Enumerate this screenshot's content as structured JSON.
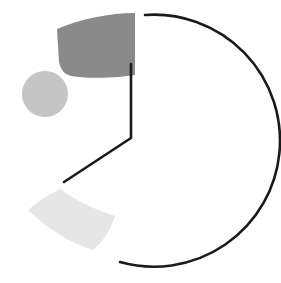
{
  "figure": {
    "title": "",
    "background": "#ffffff",
    "width": 281,
    "height": 283
  },
  "chart_data": {
    "type": "pie",
    "title": "",
    "subtitle": "",
    "xlabel": "",
    "ylabel": "",
    "legend": [],
    "grid": false,
    "center": [
      131,
      138
    ],
    "radius": 126,
    "start_angle_deg": 90,
    "direction": "clockwise",
    "exploded": true,
    "labels": [
      "Segment 1",
      "Segment 2",
      "Segment 3",
      "Segment 4"
    ],
    "values": [
      48.6,
      17.5,
      6.4,
      27.5
    ],
    "slices": [
      {
        "label": "Segment 1",
        "value": 48.6,
        "fill": "none",
        "stroke": "#1a1a1a",
        "stroke_width": 2.6,
        "exploded": false,
        "explode_offset": 0,
        "start_angle_deg": 90,
        "end_angle_deg": 265
      },
      {
        "label": "Segment 2",
        "value": 17.5,
        "fill": "#8a8a8a",
        "stroke": "none",
        "stroke_width": 0,
        "exploded": true,
        "explode_offset": 70,
        "start_angle_deg": 90,
        "end_angle_deg": 153
      },
      {
        "label": "Segment 3",
        "value": 6.4,
        "fill": "#c5c5c5",
        "stroke": "none",
        "stroke_width": 0,
        "exploded": true,
        "explode_offset": 96,
        "start_angle_deg": 153,
        "end_angle_deg": 176
      },
      {
        "label": "Segment 4",
        "value": 27.5,
        "fill": "#e6e6e6",
        "stroke": "none",
        "stroke_width": 0,
        "exploded": true,
        "explode_offset": 74,
        "start_angle_deg": 176,
        "end_angle_deg": 265
      }
    ],
    "colors": [
      "#ffffff",
      "#8a8a8a",
      "#c5c5c5",
      "#e6e6e6"
    ],
    "outline_color": "#1a1a1a",
    "paths": {
      "outline_wedge": "M 131 64 L 131 138 L 64 182 M 145 15 A 126 126 0 1 1 120 262",
      "slice_dark": "M 135 13 C 110 13 80 19 57 29 L 59 62 C 62 74 67 76 79 77 C 100 79 122 77 135 75 Z",
      "slice_dot": "M 45 71 A 23 23 0 1 1 44.9 71 Z",
      "slice_light": "M 60 189 C 48 195 37 202 28 210 C 48 229 70 243 93 250 C 104 241 111 229 115 216 C 96 210 77 201 60 189 Z"
    }
  }
}
